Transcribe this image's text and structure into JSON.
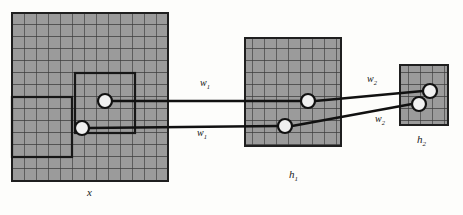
{
  "figure": {
    "kind": "neural-network-receptive-field-diagram",
    "background_color": "#fdfdfb",
    "grid_fill_color": "#9a9a9a",
    "grid_line_color": "#3a3a3a",
    "outline_color": "#1a1a1a",
    "node_fill_color": "#f2f2f2"
  },
  "layers": [
    {
      "id": "x",
      "label": "x",
      "label_sub": "",
      "cols": 13,
      "cell_size": 12,
      "rows": 14,
      "x": 12,
      "y": 13,
      "width": 156,
      "height": 168
    },
    {
      "id": "h1",
      "label": "h",
      "label_sub": "1",
      "cols": 8,
      "rows": 9,
      "cell_size": 12,
      "x": 245,
      "y": 38,
      "width": 96,
      "height": 108
    },
    {
      "id": "h2",
      "label": "h",
      "label_sub": "2",
      "cols": 4,
      "rows": 5,
      "cell_size": 12,
      "x": 400,
      "y": 65,
      "width": 48,
      "height": 60
    }
  ],
  "receptive_fields": [
    {
      "layer": "x",
      "name": "upper-receptive-field",
      "x": 75,
      "y": 73,
      "width": 60,
      "height": 60
    },
    {
      "layer": "x",
      "name": "lower-receptive-field",
      "x": 12,
      "y": 97,
      "width": 60,
      "height": 60
    }
  ],
  "nodes": [
    {
      "id": "x-upper-node",
      "layer": "x",
      "cx": 105,
      "cy": 101,
      "r": 7
    },
    {
      "id": "x-lower-node",
      "layer": "x",
      "cx": 82,
      "cy": 128,
      "r": 7
    },
    {
      "id": "h1-upper-node",
      "layer": "h1",
      "cx": 308,
      "cy": 101,
      "r": 7
    },
    {
      "id": "h1-lower-node",
      "layer": "h1",
      "cx": 285,
      "cy": 126,
      "r": 7
    },
    {
      "id": "h2-upper-node",
      "layer": "h2",
      "cx": 430,
      "cy": 91,
      "r": 7
    },
    {
      "id": "h2-lower-node",
      "layer": "h2",
      "cx": 419,
      "cy": 104,
      "r": 7
    }
  ],
  "connections": [
    {
      "id": "conn-x-upper-to-h1-upper",
      "from": "x-upper-node",
      "to": "h1-upper-node",
      "x1": 112,
      "y1": 101,
      "x2": 301,
      "y2": 101
    },
    {
      "id": "conn-x-lower-to-h1-lower",
      "from": "x-lower-node",
      "to": "h1-lower-node",
      "x1": 89,
      "y1": 128,
      "x2": 278,
      "y2": 126
    },
    {
      "id": "conn-h1-upper-to-h2-upper",
      "from": "h1-upper-node",
      "to": "h2-upper-node",
      "x1": 315,
      "y1": 101,
      "x2": 423,
      "y2": 91
    },
    {
      "id": "conn-h1-lower-to-h2-lower",
      "from": "h1-lower-node",
      "to": "h2-lower-node",
      "x1": 292,
      "y1": 126,
      "x2": 412,
      "y2": 104
    }
  ],
  "weight_labels": [
    {
      "id": "weight-w1-upper",
      "base": "w",
      "sub": "1",
      "x": 200,
      "y": 84
    },
    {
      "id": "weight-w1-lower",
      "base": "w",
      "sub": "1",
      "x": 197,
      "y": 134
    },
    {
      "id": "weight-w2-upper",
      "base": "w",
      "sub": "2",
      "x": 367,
      "y": 80
    },
    {
      "id": "weight-w2-lower",
      "base": "w",
      "sub": "2",
      "x": 375,
      "y": 120
    }
  ],
  "layer_label_positions": [
    {
      "id": "label-x",
      "x": 87,
      "y": 191
    },
    {
      "id": "label-h1",
      "x": 289,
      "y": 173
    },
    {
      "id": "label-h2",
      "x": 417,
      "y": 138
    }
  ]
}
